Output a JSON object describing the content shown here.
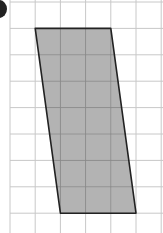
{
  "figure": {
    "title": "",
    "grid": {
      "columns": 6,
      "rows": 9,
      "line_color": "#c8c8c8"
    },
    "shape": {
      "type": "parallelogram",
      "fill": "#b3b3b3",
      "stroke": "#222222",
      "vertices_grid": [
        [
          1,
          1
        ],
        [
          4,
          1
        ],
        [
          5,
          8
        ],
        [
          2,
          8
        ]
      ]
    }
  }
}
